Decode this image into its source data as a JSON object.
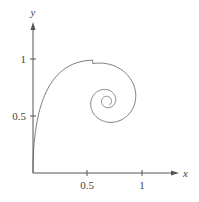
{
  "chart_data": {
    "type": "line",
    "title": "",
    "xlabel": "x",
    "ylabel": "y",
    "xlim": [
      0,
      1.3
    ],
    "ylim": [
      0,
      1.3
    ],
    "grid": false,
    "legend": null,
    "x_ticks": [
      {
        "value": 0.5,
        "label": "0.5"
      },
      {
        "value": 1,
        "label": "1"
      }
    ],
    "y_ticks": [
      {
        "value": 0.5,
        "label": "0.5"
      },
      {
        "value": 1,
        "label": "1"
      }
    ],
    "series": [
      {
        "name": "trajectory",
        "description": "Phase-plane trajectory starting at the origin, rising along the y-axis, looping clockwise and spiralling inward to an equilibrium near (0.68, 0.63)",
        "start": [
          0,
          0
        ],
        "equilibrium": [
          0.68,
          0.63
        ],
        "key_points": [
          {
            "x": 0.0,
            "y": 0.0
          },
          {
            "x": 0.02,
            "y": 0.4
          },
          {
            "x": 0.1,
            "y": 0.75
          },
          {
            "x": 0.3,
            "y": 0.95
          },
          {
            "x": 0.62,
            "y": 0.99
          },
          {
            "x": 0.9,
            "y": 0.85
          },
          {
            "x": 0.92,
            "y": 0.68
          },
          {
            "x": 0.82,
            "y": 0.5
          },
          {
            "x": 0.62,
            "y": 0.42
          },
          {
            "x": 0.44,
            "y": 0.55
          },
          {
            "x": 0.5,
            "y": 0.75
          },
          {
            "x": 0.68,
            "y": 0.8
          },
          {
            "x": 0.8,
            "y": 0.66
          },
          {
            "x": 0.68,
            "y": 0.51
          },
          {
            "x": 0.56,
            "y": 0.63
          },
          {
            "x": 0.68,
            "y": 0.7
          },
          {
            "x": 0.68,
            "y": 0.63
          }
        ]
      }
    ]
  },
  "axes": {
    "x_label": "x",
    "y_label": "y",
    "x_tick_labels": [
      "0.5",
      "1"
    ],
    "y_tick_labels": [
      "0.5",
      "1"
    ]
  }
}
